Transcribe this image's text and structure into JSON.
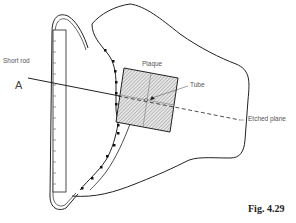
{
  "figure": {
    "caption": "Fig. 4.29",
    "labels": {
      "short_rod": "Short rod",
      "point_a": "A",
      "plaque": "Plaque",
      "tube": "Tube",
      "etched_plane": "Etched plane"
    }
  },
  "colors": {
    "line": "#222222",
    "hatch_fill": "#cfcfcf",
    "label_text": "#555555"
  }
}
